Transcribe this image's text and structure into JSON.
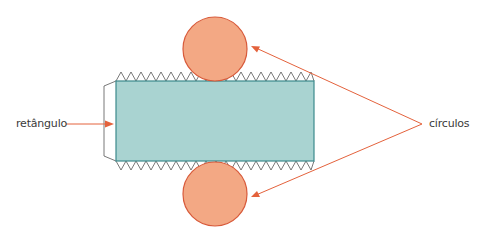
{
  "diagram": {
    "labels": {
      "rectangle": "retângulo",
      "circles": "círculos"
    },
    "colors": {
      "rectangle_fill": "#a9d3d1",
      "rectangle_stroke": "#3d8a8c",
      "circle_fill": "#f3a884",
      "circle_stroke": "#d85a3a",
      "arrow": "#e4623c",
      "outline": "#555555"
    },
    "shapes": {
      "rectangle": {
        "x": 116,
        "y": 81,
        "width": 198,
        "height": 80
      },
      "top_circle": {
        "cx": 215,
        "cy": 49,
        "r": 32
      },
      "bottom_circle": {
        "cx": 215,
        "cy": 194,
        "r": 32
      }
    }
  }
}
